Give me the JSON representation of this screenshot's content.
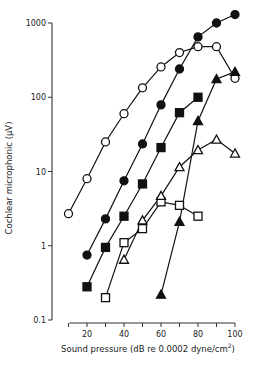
{
  "chart_data": {
    "type": "scatter",
    "title": "",
    "xlabel": "Sound pressure (dB re 0.0002 dyne/cm²)",
    "xlabel_main": "Sound pressure (dB re 0.0002 dyne/cm",
    "xlabel_sup": "2",
    "xlabel_end": ")",
    "ylabel": "Cochlear microphonic (μV)",
    "xlim": [
      10,
      100
    ],
    "ylim": [
      0.1,
      1000
    ],
    "yscale": "log",
    "x_ticks": [
      10,
      20,
      30,
      40,
      50,
      60,
      70,
      80,
      90,
      100
    ],
    "x_tick_labels": [
      "20",
      "40",
      "60",
      "80",
      "100"
    ],
    "x_tick_label_values": [
      20,
      40,
      60,
      80,
      100
    ],
    "y_ticks": [
      0.1,
      1,
      10,
      100,
      1000
    ],
    "y_tick_labels": [
      "0.1",
      "1",
      "10",
      "100",
      "1000"
    ],
    "grid": false,
    "legend": null,
    "series": [
      {
        "name": "open circles",
        "marker": "circle",
        "filled": false,
        "x": [
          10,
          20,
          30,
          40,
          50,
          60,
          70,
          80,
          90,
          100
        ],
        "values": [
          2.7,
          8,
          25,
          60,
          134,
          256,
          400,
          480,
          480,
          180
        ]
      },
      {
        "name": "filled circles",
        "marker": "circle",
        "filled": true,
        "x": [
          20,
          30,
          40,
          50,
          60,
          70,
          80,
          90,
          100
        ],
        "values": [
          0.75,
          2.3,
          7.5,
          23.5,
          79,
          240,
          650,
          1000,
          1300
        ]
      },
      {
        "name": "filled squares",
        "marker": "square",
        "filled": true,
        "x": [
          20,
          30,
          40,
          50,
          60,
          70,
          80
        ],
        "values": [
          0.28,
          0.95,
          2.5,
          6.8,
          21,
          62,
          100
        ]
      },
      {
        "name": "open squares",
        "marker": "square",
        "filled": false,
        "x": [
          30,
          40,
          50,
          60,
          70,
          80
        ],
        "values": [
          0.2,
          1.1,
          1.7,
          3.9,
          3.5,
          2.5
        ]
      },
      {
        "name": "open triangles",
        "marker": "triangle",
        "filled": false,
        "x": [
          40,
          50,
          60,
          70,
          80,
          90,
          100
        ],
        "values": [
          0.65,
          2.2,
          4.7,
          11.5,
          19.5,
          27,
          17.5
        ]
      },
      {
        "name": "filled triangles",
        "marker": "triangle",
        "filled": true,
        "x": [
          60,
          70,
          80,
          90,
          100
        ],
        "values": [
          0.22,
          2.1,
          48,
          176,
          220
        ]
      }
    ]
  },
  "colors": {
    "ink": "#111111",
    "axis": "#333333",
    "background": "#ffffff"
  }
}
